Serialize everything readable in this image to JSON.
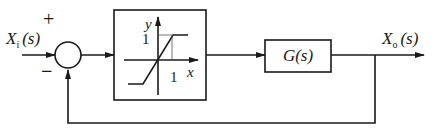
{
  "diagram": {
    "type": "feedback-control-block-diagram",
    "input_label": "X",
    "input_subscript": "i",
    "input_arg": "(s)",
    "output_label": "X",
    "output_subscript": "o",
    "output_arg": "(s)",
    "summing_junction": {
      "plus_sign": "+",
      "minus_sign": "−"
    },
    "nonlinear_block": {
      "description": "saturation nonlinearity",
      "y_axis_label": "y",
      "x_axis_label": "x",
      "y_tick": "1",
      "x_tick": "1"
    },
    "plant_block": {
      "label": "G(s)"
    },
    "feedback": "unity negative feedback"
  }
}
